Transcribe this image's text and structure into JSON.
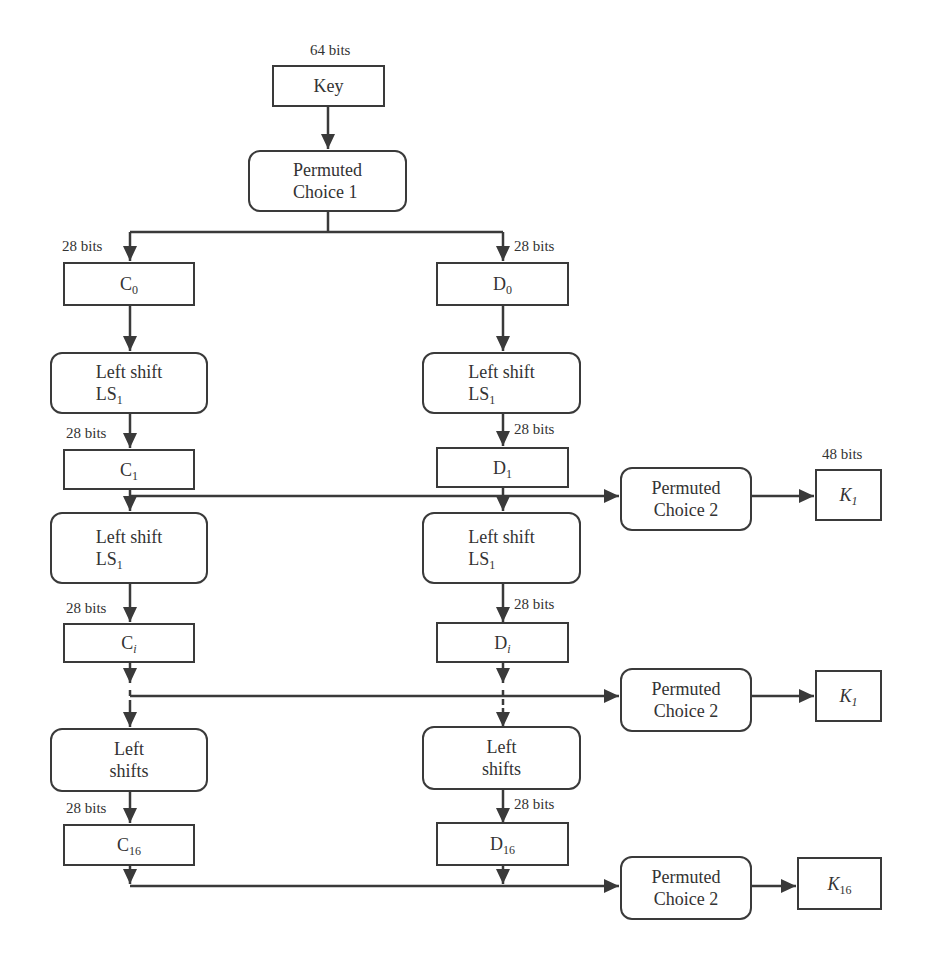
{
  "diagram": {
    "title_hint": "DES key schedule",
    "key": {
      "label": "Key",
      "bits": "64 bits"
    },
    "pc1": {
      "line1": "Permuted",
      "line2": "Choice  1"
    },
    "split_bits_left": "28 bits",
    "split_bits_right": "28 bits",
    "c0": {
      "base": "C",
      "sub": "0"
    },
    "d0": {
      "base": "D",
      "sub": "0"
    },
    "row1": {
      "ls_c": {
        "line1": "Left shift",
        "base": "LS",
        "sub": "1"
      },
      "ls_d": {
        "line1": "Left shift",
        "base": "LS",
        "sub": "1"
      },
      "bits_c": "28 bits",
      "bits_d": "28 bits",
      "c": {
        "base": "C",
        "sub": "1"
      },
      "d": {
        "base": "D",
        "sub": "1"
      },
      "pc2": {
        "line1": "Permuted",
        "line2": "Choice 2"
      },
      "k": {
        "base": "K",
        "sub": "1"
      },
      "k_bits": "48 bits"
    },
    "row2": {
      "ls_c": {
        "line1": "Left shift",
        "base": "LS",
        "sub": "1"
      },
      "ls_d": {
        "line1": "Left shift",
        "base": "LS",
        "sub": "1"
      },
      "bits_c": "28 bits",
      "bits_d": "28 bits",
      "c": {
        "base": "C",
        "sub": "i"
      },
      "d": {
        "base": "D",
        "sub": "i"
      },
      "pc2": {
        "line1": "Permuted",
        "line2": "Choice 2"
      },
      "k": {
        "base": "K",
        "sub": "1"
      }
    },
    "row3": {
      "ls_c": {
        "line1": "Left",
        "line2": "shifts"
      },
      "ls_d": {
        "line1": "Left",
        "line2": "shifts"
      },
      "bits_c": "28 bits",
      "bits_d": "28 bits",
      "c": {
        "base": "C",
        "sub": "16"
      },
      "d": {
        "base": "D",
        "sub": "16"
      },
      "pc2": {
        "line1": "Permuted",
        "line2": "Choice 2"
      },
      "k": {
        "base": "K",
        "sub": "16"
      }
    },
    "colors": {
      "stroke": "#3a3a3a",
      "text": "#333333",
      "background": "#ffffff"
    }
  }
}
